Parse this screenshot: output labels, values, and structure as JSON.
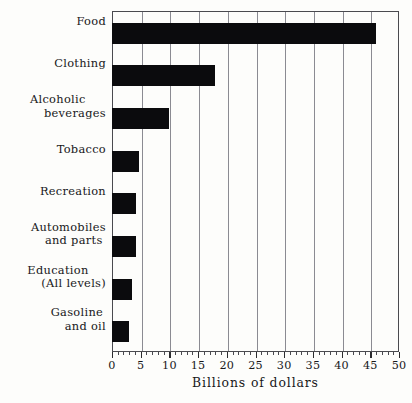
{
  "chart_data": {
    "type": "bar",
    "orientation": "horizontal",
    "title": "",
    "xlabel": "Billions of dollars",
    "ylabel": "",
    "xlim": [
      0,
      50
    ],
    "ylim": null,
    "grid": true,
    "legend": null,
    "bar_color": "#0b0b0d",
    "categories": [
      "Food",
      "Clothing",
      "Alcoholic beverages",
      "Tobacco",
      "Recreation",
      "Automobiles and parts",
      "Education (All levels)",
      "Gasoline and oil"
    ],
    "values": [
      46,
      18,
      10,
      4.7,
      4.2,
      4.2,
      3.5,
      3.0
    ],
    "x_tick_labels": [
      "0",
      "5",
      "10",
      "15",
      "20",
      "25",
      "30",
      "35",
      "40",
      "45",
      "50"
    ],
    "x_tick_values": [
      0,
      5,
      10,
      15,
      20,
      25,
      30,
      35,
      40,
      45,
      50
    ],
    "x_minor_tick_interval": 1
  },
  "labels": [
    {
      "line1": "Food",
      "line2": ""
    },
    {
      "line1": "Clothing",
      "line2": ""
    },
    {
      "line1": "Alcoholic",
      "line2": "beverages"
    },
    {
      "line1": "Tobacco",
      "line2": ""
    },
    {
      "line1": "Recreation",
      "line2": ""
    },
    {
      "line1": "Automobiles",
      "line2": "and parts"
    },
    {
      "line1": "Education",
      "line2": "(All levels)"
    },
    {
      "line1": "Gasoline",
      "line2": "and oil"
    }
  ],
  "axis": {
    "title": "Billions of dollars"
  }
}
